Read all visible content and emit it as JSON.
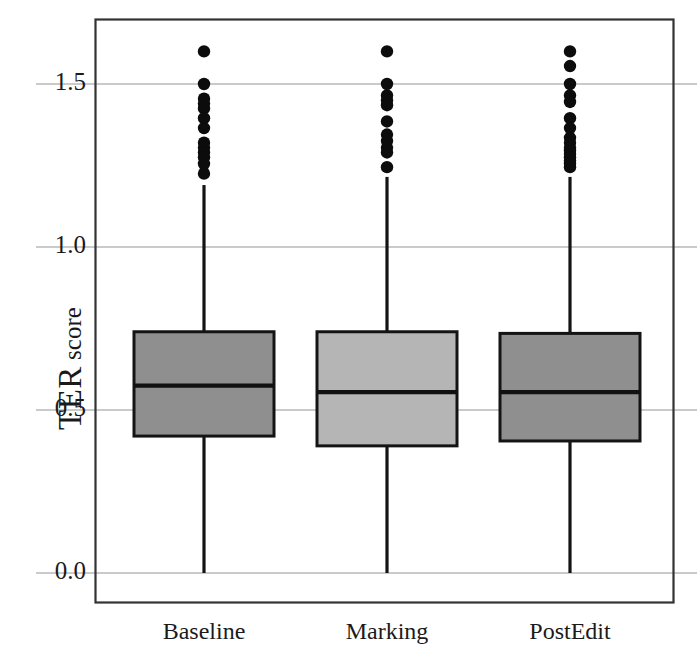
{
  "chart_data": {
    "type": "box",
    "title": "",
    "xlabel": "",
    "ylabel": "TER score",
    "ylabel_main": "TER",
    "ylabel_sub": "score",
    "categories": [
      "Baseline",
      "Marking",
      "PostEdit"
    ],
    "ytick_labels": [
      "0.0",
      "0.5",
      "1.0",
      "1.5"
    ],
    "yticks": [
      0.0,
      0.5,
      1.0,
      1.5
    ],
    "ylim": [
      -0.04,
      1.7
    ],
    "grid": "horizontal",
    "legend": "none",
    "colors": {
      "box_fill_baseline": "#8f8f8f",
      "box_fill_marking": "#b5b5b5",
      "box_fill_postedit": "#8f8f8f",
      "box_edge": "#141414",
      "median": "#111111",
      "whisker": "#141414",
      "outlier": "#0c0c0c",
      "grid": "#b9b9b9",
      "frame": "#333333",
      "background": "#ffffff",
      "text": "#1a1a1a"
    },
    "boxes": [
      {
        "name": "Baseline",
        "fill": "#8f8f8f",
        "whisker_low": 0.0,
        "q1": 0.42,
        "median": 0.575,
        "q3": 0.74,
        "whisker_high": 1.19,
        "outliers": [
          1.6,
          1.5,
          1.455,
          1.44,
          1.425,
          1.395,
          1.365,
          1.32,
          1.305,
          1.29,
          1.275,
          1.255,
          1.225
        ]
      },
      {
        "name": "Marking",
        "fill": "#b5b5b5",
        "whisker_low": 0.0,
        "q1": 0.39,
        "median": 0.555,
        "q3": 0.74,
        "whisker_high": 1.215,
        "outliers": [
          1.6,
          1.5,
          1.465,
          1.45,
          1.435,
          1.385,
          1.345,
          1.325,
          1.305,
          1.29,
          1.245
        ]
      },
      {
        "name": "PostEdit",
        "fill": "#8f8f8f",
        "whisker_low": 0.0,
        "q1": 0.405,
        "median": 0.555,
        "q3": 0.735,
        "whisker_high": 1.215,
        "outliers": [
          1.6,
          1.555,
          1.5,
          1.465,
          1.445,
          1.395,
          1.365,
          1.335,
          1.32,
          1.305,
          1.295,
          1.285,
          1.275,
          1.265,
          1.255,
          1.245
        ]
      }
    ]
  },
  "plot": {
    "frame": {
      "left": 95,
      "top": 19,
      "right": 673,
      "bottom": 602
    },
    "y_px": {
      "v0": 573,
      "scale_per_unit": 326
    },
    "box_half_width": 70,
    "centers_px": [
      204,
      387,
      570
    ]
  }
}
